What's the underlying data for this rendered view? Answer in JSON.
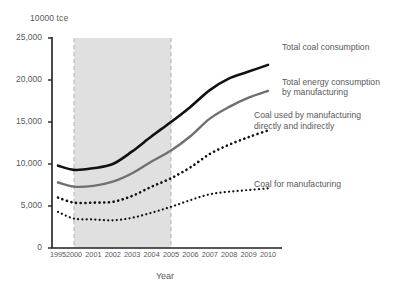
{
  "chart_data": {
    "type": "line",
    "title": "",
    "unit_label": "10000 tce",
    "xlabel": "Year",
    "ylabel": "",
    "x": [
      1995,
      2000,
      2001,
      2002,
      2003,
      2004,
      2005,
      2006,
      2007,
      2008,
      2009,
      2010
    ],
    "xtick_labels": [
      "1995",
      "2000",
      "2001",
      "2002",
      "2003",
      "2004",
      "2005",
      "2006",
      "2007",
      "2008",
      "2009",
      "2010"
    ],
    "ylim": [
      0,
      25000
    ],
    "ytick_values": [
      0,
      5000,
      10000,
      15000,
      20000,
      25000
    ],
    "ytick_labels": [
      "0",
      "5,000",
      "10,000",
      "15,000",
      "20,000",
      "25,000"
    ],
    "grid": false,
    "legend_position": "right-inline",
    "shaded_band": {
      "from": 2000,
      "to": 2005,
      "color": "#e0e0e0",
      "label": ""
    },
    "series": [
      {
        "name": "Total coal consumption",
        "style": "solid",
        "color": "#111111",
        "width": 2.6,
        "values": [
          9800,
          9300,
          9500,
          10000,
          11500,
          13300,
          15000,
          16800,
          18800,
          20200,
          21000,
          21800
        ]
      },
      {
        "name": "Total energy consumption\nby manufacturing",
        "style": "solid",
        "color": "#6f7072",
        "width": 2.4,
        "values": [
          7800,
          7300,
          7400,
          7900,
          8900,
          10300,
          11600,
          13300,
          15400,
          16800,
          17900,
          18700
        ]
      },
      {
        "name": "Coal used by manufacturing\ndirectly and indirectly",
        "style": "dotted-thick",
        "color": "#111111",
        "width": 2.6,
        "values": [
          6000,
          5400,
          5400,
          5500,
          6200,
          7300,
          8300,
          9600,
          11200,
          12300,
          13200,
          14000
        ]
      },
      {
        "name": "Coal for manufacturing",
        "style": "dotted-thin",
        "color": "#111111",
        "width": 2.2,
        "values": [
          4300,
          3500,
          3400,
          3300,
          3600,
          4200,
          4900,
          5700,
          6400,
          6700,
          6900,
          7100
        ]
      }
    ]
  },
  "axis": {
    "unit": "10000 tce",
    "x_title": "Year"
  },
  "legend": {
    "items": [
      {
        "label": "Total coal consumption"
      },
      {
        "label": "Total energy consumption\nby manufacturing"
      },
      {
        "label": "Coal used by manufacturing\ndirectly and indirectly"
      },
      {
        "label": "Coal for manufacturing"
      }
    ]
  },
  "footer": {
    "faint_text": ""
  }
}
